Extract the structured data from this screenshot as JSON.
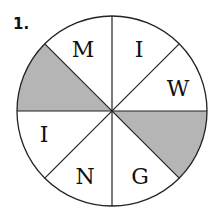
{
  "problem": {
    "number": "1."
  },
  "wheel": {
    "shade_color": "#b5b5b5",
    "sectors": [
      {
        "position": "top-left",
        "letter": "M",
        "shaded": false
      },
      {
        "position": "top-right",
        "letter": "I",
        "shaded": false
      },
      {
        "position": "right-upper",
        "letter": "W",
        "shaded": false
      },
      {
        "position": "right-lower",
        "letter": "",
        "shaded": true
      },
      {
        "position": "bottom-right",
        "letter": "G",
        "shaded": false
      },
      {
        "position": "bottom-left",
        "letter": "N",
        "shaded": false
      },
      {
        "position": "left-lower",
        "letter": "I",
        "shaded": false
      },
      {
        "position": "left-upper",
        "letter": "",
        "shaded": true
      }
    ]
  }
}
